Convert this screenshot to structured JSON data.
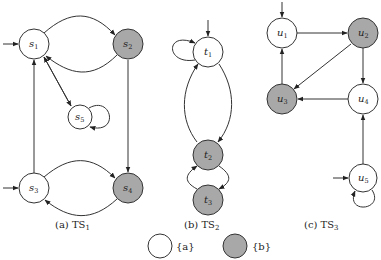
{
  "colors": {
    "labeled_a": "#ffffff",
    "labeled_b": "#a8a8a8",
    "stroke": "#333333"
  },
  "systems": [
    {
      "id": "TS1",
      "caption_prefix": "(a) TS",
      "caption_sub": "1",
      "states": [
        {
          "id": "s1",
          "base": "s",
          "sub": "1",
          "label": "a",
          "initial": true
        },
        {
          "id": "s2",
          "base": "s",
          "sub": "2",
          "label": "b",
          "initial": false
        },
        {
          "id": "s5",
          "base": "s",
          "sub": "5",
          "label": "a",
          "initial": false
        },
        {
          "id": "s3",
          "base": "s",
          "sub": "3",
          "label": "a",
          "initial": true
        },
        {
          "id": "s4",
          "base": "s",
          "sub": "4",
          "label": "b",
          "initial": false
        }
      ],
      "transitions": [
        [
          "s1",
          "s2"
        ],
        [
          "s2",
          "s1"
        ],
        [
          "s1",
          "s5"
        ],
        [
          "s5",
          "s1"
        ],
        [
          "s5",
          "s5"
        ],
        [
          "s3",
          "s1"
        ],
        [
          "s2",
          "s4"
        ],
        [
          "s3",
          "s4"
        ],
        [
          "s4",
          "s3"
        ]
      ]
    },
    {
      "id": "TS2",
      "caption_prefix": "(b) TS",
      "caption_sub": "2",
      "states": [
        {
          "id": "t1",
          "base": "t",
          "sub": "1",
          "label": "a",
          "initial": true
        },
        {
          "id": "t2",
          "base": "t",
          "sub": "2",
          "label": "b",
          "initial": false
        },
        {
          "id": "t3",
          "base": "t",
          "sub": "3",
          "label": "b",
          "initial": false
        }
      ],
      "transitions": [
        [
          "t1",
          "t1"
        ],
        [
          "t1",
          "t2"
        ],
        [
          "t2",
          "t1"
        ],
        [
          "t2",
          "t3"
        ],
        [
          "t3",
          "t2"
        ]
      ]
    },
    {
      "id": "TS3",
      "caption_prefix": "(c) TS",
      "caption_sub": "3",
      "states": [
        {
          "id": "u1",
          "base": "u",
          "sub": "1",
          "label": "a",
          "initial": true
        },
        {
          "id": "u2",
          "base": "u",
          "sub": "2",
          "label": "b",
          "initial": false
        },
        {
          "id": "u3",
          "base": "u",
          "sub": "3",
          "label": "b",
          "initial": false
        },
        {
          "id": "u4",
          "base": "u",
          "sub": "4",
          "label": "a",
          "initial": false
        },
        {
          "id": "u5",
          "base": "u",
          "sub": "5",
          "label": "a",
          "initial": true
        }
      ],
      "transitions": [
        [
          "u1",
          "u2"
        ],
        [
          "u2",
          "u3"
        ],
        [
          "u2",
          "u4"
        ],
        [
          "u3",
          "u1"
        ],
        [
          "u4",
          "u3"
        ],
        [
          "u5",
          "u4"
        ],
        [
          "u5",
          "u5"
        ]
      ]
    }
  ],
  "legend": [
    {
      "fill": "white",
      "text": "{a}"
    },
    {
      "fill": "gray",
      "text": "{b}"
    }
  ]
}
